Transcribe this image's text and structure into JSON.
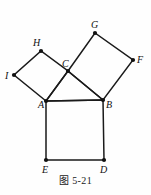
{
  "figure": {
    "caption": "图 5-21",
    "type": "geometric-diagram",
    "stroke_color": "#1a1a1a",
    "vertex_color": "#111111",
    "background_color": "#fefefe",
    "vertices": [
      {
        "id": "A",
        "label": "A",
        "x": 46,
        "y": 101,
        "label_x": 38,
        "label_y": 108
      },
      {
        "id": "B",
        "label": "B",
        "x": 103,
        "y": 100,
        "label_x": 106,
        "label_y": 108
      },
      {
        "id": "C",
        "label": "C",
        "x": 68,
        "y": 71,
        "label_x": 63,
        "label_y": 67
      },
      {
        "id": "D",
        "label": "D",
        "x": 104,
        "y": 160,
        "label_x": 101,
        "label_y": 173
      },
      {
        "id": "E",
        "label": "E",
        "x": 46,
        "y": 160,
        "label_x": 43,
        "label_y": 173
      },
      {
        "id": "F",
        "label": "F",
        "x": 133,
        "y": 60,
        "label_x": 137,
        "label_y": 63
      },
      {
        "id": "G",
        "label": "G",
        "x": 95,
        "y": 33,
        "label_x": 92,
        "label_y": 28
      },
      {
        "id": "H",
        "label": "H",
        "x": 41,
        "y": 51,
        "label_x": 34,
        "label_y": 45
      },
      {
        "id": "I",
        "label": "I",
        "x": 14,
        "y": 75,
        "label_x": 6,
        "label_y": 79
      }
    ],
    "squares": [
      {
        "name": "square-ABDE",
        "points": "46,101 103,100 104,160 46,160"
      },
      {
        "name": "square-AIHC",
        "points": "46,101 14,75 41,51 68,71"
      },
      {
        "name": "square-CGFB",
        "points": "68,71 95,33 133,60 103,100"
      }
    ],
    "segments": [
      {
        "name": "segment-AB",
        "x1": 46,
        "y1": 101,
        "x2": 103,
        "y2": 100
      },
      {
        "name": "segment-AC",
        "x1": 46,
        "y1": 101,
        "x2": 68,
        "y2": 71
      },
      {
        "name": "segment-CB",
        "x1": 68,
        "y1": 71,
        "x2": 103,
        "y2": 100
      }
    ]
  }
}
